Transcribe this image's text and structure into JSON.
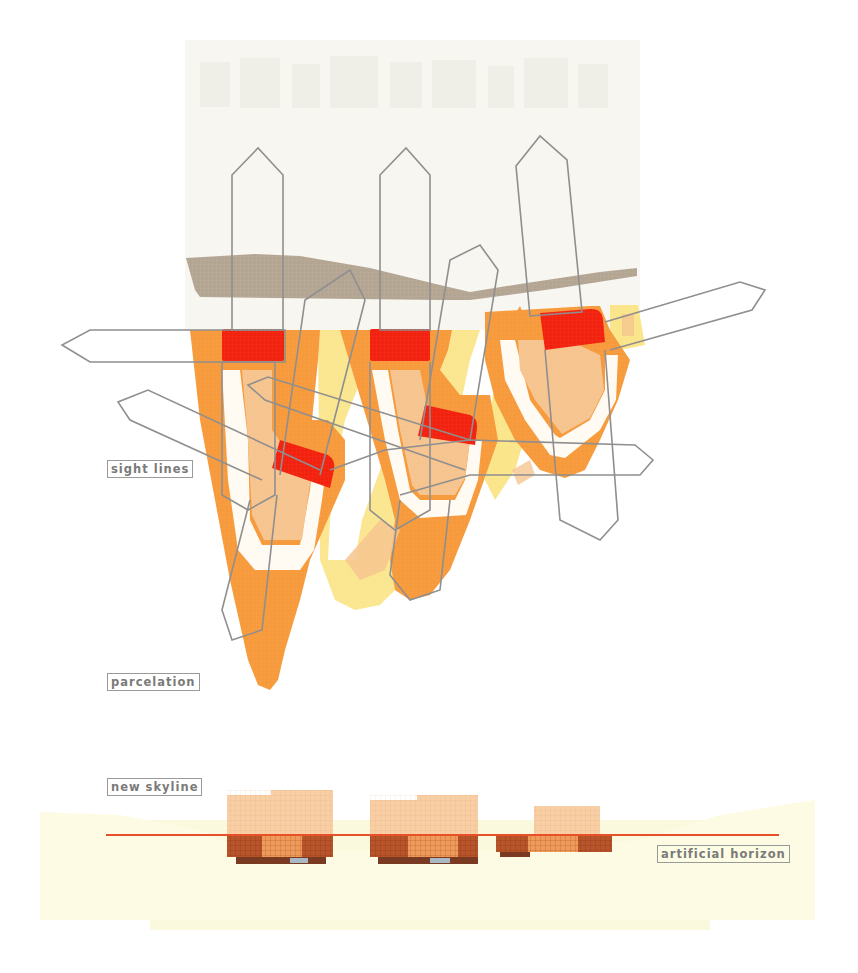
{
  "diagram": {
    "type": "architectural concept diagram (plan + elevation)",
    "labels": {
      "sight_lines": "sight lines",
      "parcelation": "parcelation",
      "new_skyline": "new skyline",
      "artificial_horizon": "artificial horizon"
    },
    "colors": {
      "background": "#ffffff",
      "faint_city_backdrop": "#f3f2ec",
      "street_band_taupe": "#b4a593",
      "parcel_orange": "#f79a3c",
      "parcel_light_orange": "#f6c48f",
      "parcel_yellow": "#fbe58a",
      "building_footprint_red": "#f2220f",
      "sight_line_outline": "#8f8f8f",
      "ground_cream": "#fdfbe3",
      "tower_light": "#f8cfa4",
      "podium_dark": "#b8542a",
      "podium_mid": "#f09a5a",
      "horizon_line": "#e8502a",
      "label_text": "#7a7a78"
    },
    "plan": {
      "parcels": 5,
      "building_footprints": 5,
      "sight_line_arrows": 8
    },
    "elevation": {
      "building_clusters": 3
    }
  }
}
